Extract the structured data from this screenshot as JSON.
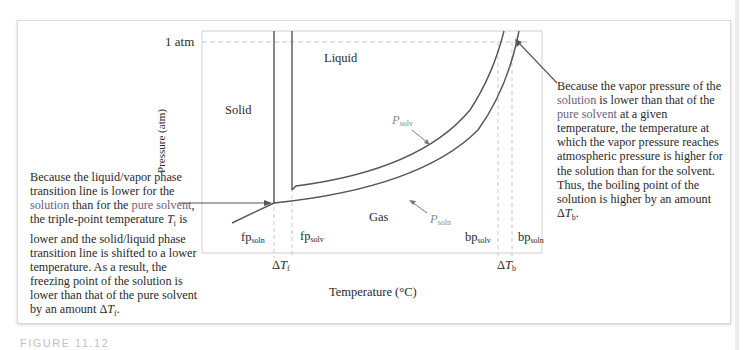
{
  "figure": {
    "caption": "FIGURE 11.12",
    "region_labels": {
      "solid": "Solid",
      "liquid": "Liquid",
      "gas": "Gas"
    },
    "axes": {
      "y_label": "Pressure (atm)",
      "x_label": "Temperature (°C)",
      "one_atm_tick": "1 atm"
    },
    "curve_labels": {
      "p_solv": {
        "main": "P",
        "sub": "solv"
      },
      "p_soln": {
        "main": "P",
        "sub": "soln"
      }
    },
    "point_labels": {
      "fp_soln": {
        "main": "fp",
        "sub": "soln"
      },
      "fp_solv": {
        "main": "fp",
        "sub": "solv"
      },
      "bp_solv": {
        "main": "bp",
        "sub": "solv"
      },
      "bp_soln": {
        "main": "bp",
        "sub": "soln"
      },
      "delta_tf": {
        "delta": "Δ",
        "main": "T",
        "sub": "f"
      },
      "delta_tb": {
        "delta": "Δ",
        "main": "T",
        "sub": "b"
      }
    },
    "notes": {
      "left": {
        "parts": [
          "Because the liquid/vapor phase transition line is lower for the ",
          "solution",
          " than for the ",
          "pure solvent",
          ", the triple-point temperature ",
          "T",
          "t",
          " is lower and the solid/liquid phase transition line is shifted to a lower temperature. As a result, the freezing point of the solution is lower than that of the pure solvent by an amount Δ",
          "T",
          "f",
          "."
        ]
      },
      "right": {
        "parts": [
          "Because the vapor pressure of the ",
          "solution",
          " is lower than that of the ",
          "pure solvent",
          " at a given temperature, the temperature at which the vapor pressure reaches atmospheric pressure is higher for the solution than for the solvent. Thus, the boiling point of the solution is higher by an amount Δ",
          "T",
          "b",
          "."
        ]
      }
    },
    "colors": {
      "curve": "#555555",
      "dashed": "#c8c8c8",
      "plot_border": "#d0d0d0",
      "highlight_text": "#6b5e7a",
      "label_gray": "#8a8a8a"
    }
  }
}
